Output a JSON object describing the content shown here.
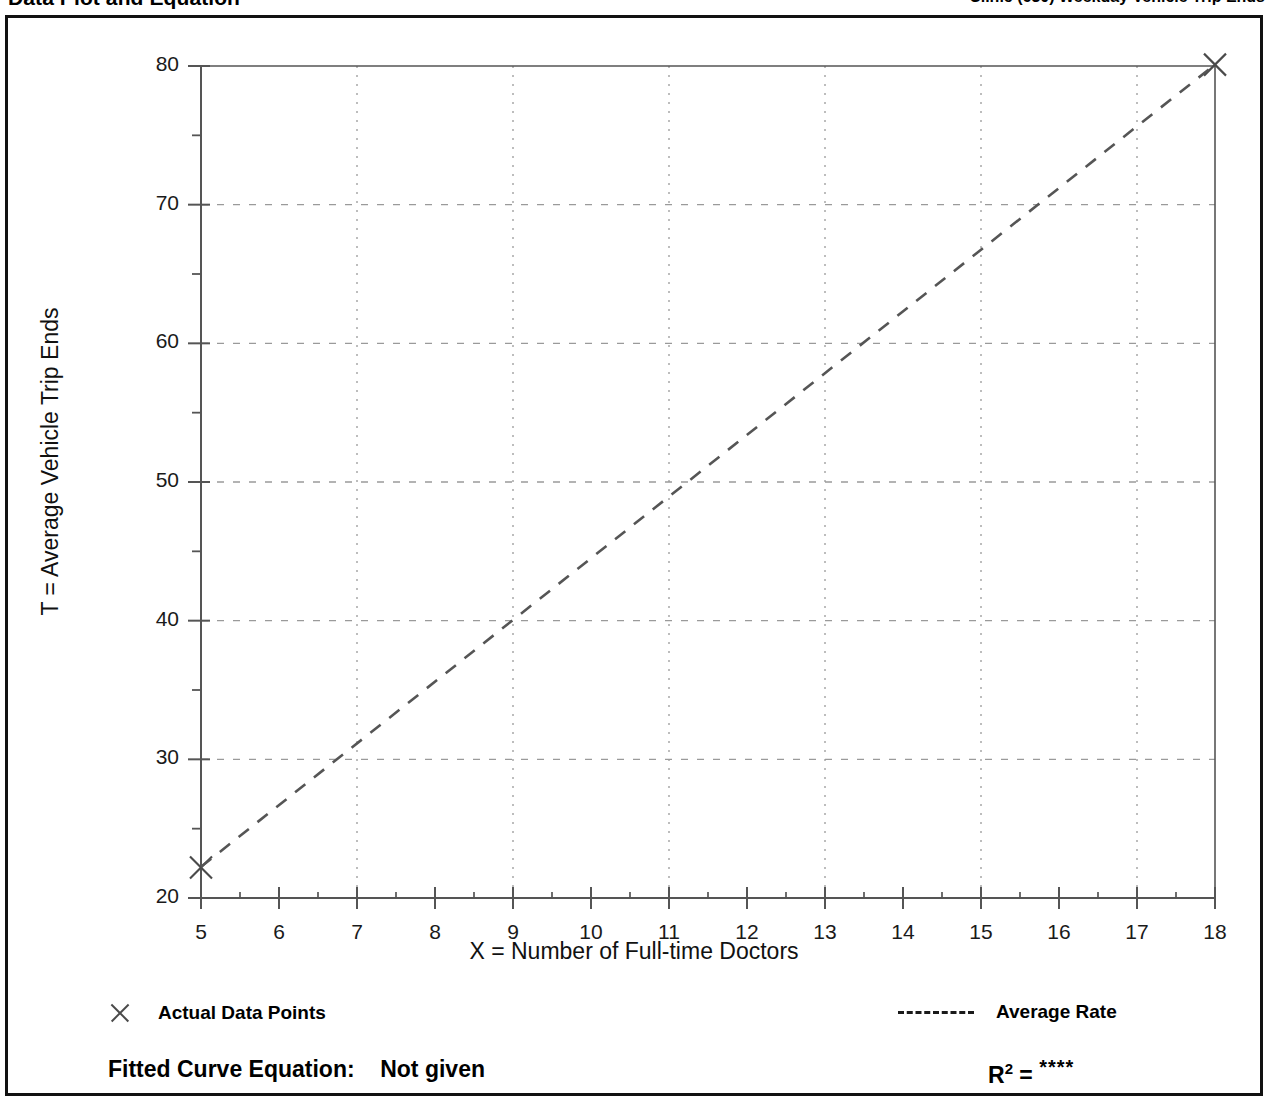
{
  "header": {
    "left_title": "Data Plot and Equation",
    "right_title": "Clinic  (630)  Weekday  Vehicle Trip Ends"
  },
  "chart_data": {
    "type": "scatter",
    "title": "",
    "xlabel": "X = Number of Full-time Doctors",
    "ylabel": "T = Average Vehicle Trip Ends",
    "xlim": [
      5,
      18
    ],
    "ylim": [
      20,
      80
    ],
    "x_ticks": [
      5,
      6,
      7,
      8,
      9,
      10,
      11,
      12,
      13,
      14,
      15,
      16,
      17,
      18
    ],
    "x_tick_labels": [
      "5",
      "6",
      "7",
      "8",
      "9",
      "10",
      "11",
      "12",
      "13",
      "14",
      "15",
      "16",
      "17",
      "18"
    ],
    "y_ticks": [
      20,
      30,
      40,
      50,
      60,
      70,
      80
    ],
    "y_tick_labels": [
      "20",
      "30",
      "40",
      "50",
      "60",
      "70",
      "80"
    ],
    "y_minor_ticks": [
      25,
      35,
      45,
      55,
      65,
      75
    ],
    "x_gridlines": [
      7,
      9,
      11,
      13,
      15,
      17
    ],
    "y_gridlines": [
      30,
      40,
      50,
      60,
      70
    ],
    "grid": true,
    "legend_position": "below-axes",
    "series": [
      {
        "name": "Actual Data Points",
        "type": "scatter",
        "marker": "x",
        "color": "#4a4a4a",
        "points": [
          {
            "x": 5,
            "y": 22.2
          },
          {
            "x": 18,
            "y": 80.1
          }
        ]
      },
      {
        "name": "Average Rate",
        "type": "line",
        "style": "dashed",
        "color": "#555555",
        "slope": 4.45,
        "intercept": 0,
        "points": [
          {
            "x": 5,
            "y": 22.25
          },
          {
            "x": 18,
            "y": 80.1
          }
        ]
      }
    ]
  },
  "legend": {
    "actual_points_label": "Actual Data Points",
    "average_rate_label": "Average Rate"
  },
  "footer": {
    "equation_label": "Fitted Curve Equation:",
    "equation_value": "Not given",
    "rsq_label": "R",
    "rsq_exponent": "2",
    "rsq_equals": "=",
    "rsq_value": "****"
  },
  "colors": {
    "frame": "#111111",
    "axis": "#555555",
    "grid": "#9a9a9a",
    "data": "#4a4a4a",
    "text": "#000000"
  }
}
